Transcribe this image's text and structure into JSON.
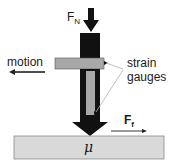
{
  "diagram": {
    "labels": {
      "normal_force": "F",
      "normal_force_sub": "N",
      "motion": "motion",
      "strain_gauges_line1": "strain",
      "strain_gauges_line2": "gauges",
      "friction_force": "F",
      "friction_force_sub": "f",
      "friction_coefficient": "μ"
    },
    "colors": {
      "probe": "#111111",
      "beam": "#a8a8a8",
      "substrate": "#d9d9d9",
      "leader_line": "#b0b0b0"
    }
  }
}
